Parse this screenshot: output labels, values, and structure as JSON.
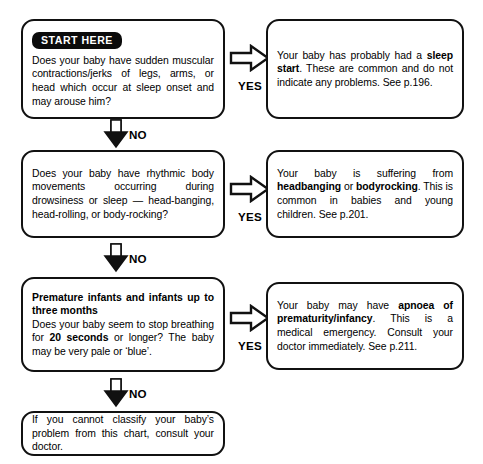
{
  "chart_title": "Baby sleep movement symptom flowchart",
  "start_badge": "START HERE",
  "connectors": {
    "yes_label": "YES",
    "no_label": "NO",
    "yes_icon": "arrow-right-icon",
    "no_icon": "arrow-down-icon"
  },
  "rows": [
    {
      "question": {
        "lead": "",
        "text": "Does your baby have sudden muscular contractions/jerks of legs, arms, or head which occur at sleep onset and may arouse him?"
      },
      "answer": {
        "segments": [
          {
            "text": "Your baby has probably had a ",
            "bold": false
          },
          {
            "text": "sleep start",
            "bold": true
          },
          {
            "text": ". These are common and do not indicate any problems.  See p.196.",
            "bold": false
          }
        ]
      }
    },
    {
      "question": {
        "lead": "",
        "text": "Does your baby have rhythmic body movements occurring during drowsiness or sleep — head-banging, head-rolling, or body-rocking?"
      },
      "answer": {
        "segments": [
          {
            "text": "Your baby is suffering from ",
            "bold": false
          },
          {
            "text": "headbanging",
            "bold": true
          },
          {
            "text": " or ",
            "bold": false
          },
          {
            "text": "bodyrocking",
            "bold": true
          },
          {
            "text": ". This is common in babies and young children. See p.201.",
            "bold": false
          }
        ]
      }
    },
    {
      "question": {
        "lead": "Premature infants and infants up to three months",
        "segments": [
          {
            "text": "Does your baby seem to stop breathing for ",
            "bold": false
          },
          {
            "text": "20 seconds",
            "bold": true
          },
          {
            "text": " or longer?  The baby may be very pale or ‘blue’.",
            "bold": false
          }
        ]
      },
      "answer": {
        "segments": [
          {
            "text": "Your baby may have ",
            "bold": false
          },
          {
            "text": "apnoea of prematurity/infancy",
            "bold": true
          },
          {
            "text": ". This is a medical emergency.  Consult your doctor immediately.  See p.211.",
            "bold": false
          }
        ]
      }
    }
  ],
  "final_box": {
    "text": "If you cannot classify your baby’s problem from this chart, consult your doctor."
  },
  "colors": {
    "stroke": "#111111",
    "background": "#ffffff",
    "badge_bg": "#0b0b0b",
    "badge_text": "#ffffff"
  }
}
